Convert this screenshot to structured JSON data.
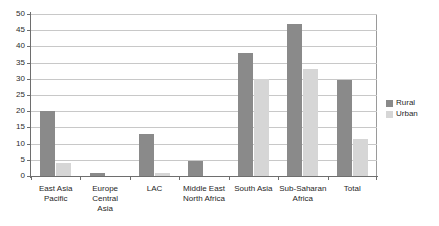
{
  "chart_data": {
    "type": "bar",
    "title": "",
    "subtitle": "",
    "xlabel": "",
    "ylabel": "",
    "ylim": [
      0,
      50
    ],
    "ytick_step": 5,
    "yticks": [
      0,
      5,
      10,
      15,
      20,
      25,
      30,
      35,
      40,
      45,
      50
    ],
    "grid": true,
    "legend_position": "right",
    "categories": [
      "East Asia Pacific",
      "Europe Central Asia",
      "LAC",
      "Middle East North Africa",
      "South Asia",
      "Sub-Saharan Africa",
      "Total"
    ],
    "category_lines": [
      [
        "East Asia",
        "Pacific"
      ],
      [
        "Europe Central",
        "Asia"
      ],
      [
        "LAC"
      ],
      [
        "Middle East",
        "North Africa"
      ],
      [
        "South Asia"
      ],
      [
        "Sub-Saharan",
        "Africa"
      ],
      [
        "Total"
      ]
    ],
    "series": [
      {
        "name": "Rural",
        "color": "#8a8a8a",
        "values": [
          20,
          1,
          13,
          4.5,
          38,
          47,
          29.5
        ]
      },
      {
        "name": "Urban",
        "color": "#d6d6d6",
        "values": [
          4,
          0,
          1,
          0,
          30,
          33,
          11.5
        ]
      }
    ]
  },
  "legend": {
    "items": [
      {
        "label": "Rural",
        "color": "#8a8a8a"
      },
      {
        "label": "Urban",
        "color": "#d6d6d6"
      }
    ]
  },
  "axis": {
    "y_labels": [
      "50",
      "45",
      "40",
      "35",
      "30",
      "25",
      "20",
      "15",
      "10",
      "5",
      "0"
    ]
  }
}
